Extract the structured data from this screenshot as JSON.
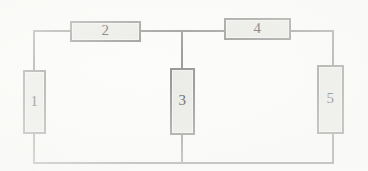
{
  "diagram": {
    "type": "resistor-network",
    "background_color": "#fdfdfc",
    "wire_color": "#8d8d8d",
    "component_fill": "#e9e9e6",
    "component_border": "#8a8a8a",
    "label_color": "#4a4a4a",
    "components": [
      {
        "id": "r1",
        "label": "1",
        "orientation": "vertical",
        "x": 23,
        "y": 70,
        "w": 23,
        "h": 64
      },
      {
        "id": "r2",
        "label": "2",
        "orientation": "horizontal",
        "x": 70,
        "y": 21,
        "w": 71,
        "h": 21
      },
      {
        "id": "r3",
        "label": "3",
        "orientation": "vertical",
        "x": 170,
        "y": 68,
        "w": 25,
        "h": 67
      },
      {
        "id": "r4",
        "label": "4",
        "orientation": "horizontal",
        "x": 224,
        "y": 18,
        "w": 67,
        "h": 22
      },
      {
        "id": "r5",
        "label": "5",
        "orientation": "vertical",
        "x": 317,
        "y": 65,
        "w": 27,
        "h": 69
      }
    ],
    "wires": [
      {
        "id": "top-left-lead",
        "orientation": "h",
        "x": 33,
        "y": 30,
        "length": 38
      },
      {
        "id": "top-mid-lead",
        "orientation": "h",
        "x": 140,
        "y": 30,
        "length": 85
      },
      {
        "id": "top-right-lead",
        "orientation": "h",
        "x": 290,
        "y": 30,
        "length": 44
      },
      {
        "id": "bottom-rail",
        "orientation": "h",
        "x": 33,
        "y": 162,
        "length": 301
      },
      {
        "id": "left-upper-lead",
        "orientation": "v",
        "x": 33,
        "y": 30,
        "length": 41
      },
      {
        "id": "left-lower-lead",
        "orientation": "v",
        "x": 33,
        "y": 133,
        "length": 30
      },
      {
        "id": "center-upper-lead",
        "orientation": "v",
        "x": 181,
        "y": 30,
        "length": 39
      },
      {
        "id": "center-lower-lead",
        "orientation": "v",
        "x": 181,
        "y": 134,
        "length": 29
      },
      {
        "id": "right-upper-lead",
        "orientation": "v",
        "x": 332,
        "y": 30,
        "length": 36
      },
      {
        "id": "right-lower-lead",
        "orientation": "v",
        "x": 332,
        "y": 133,
        "length": 30
      }
    ]
  }
}
